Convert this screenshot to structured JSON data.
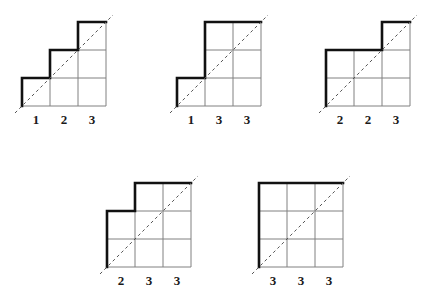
{
  "page": {
    "background_color": "#ffffff",
    "width": 435,
    "height": 294
  },
  "style": {
    "grid_line_color": "#808080",
    "outline_color": "#111111",
    "diagonal_color": "#555555",
    "label_color": "#1a1a1a",
    "cell_size": 28,
    "grid_line_width": 1,
    "outline_width": 2.6,
    "diagonal_width": 1,
    "diagonal_dash": "3 3"
  },
  "figures": [
    {
      "id": "figure-1",
      "name": "staircase-1-2-3",
      "origin": {
        "x": 22,
        "y": 106
      },
      "columns": [
        1,
        2,
        3
      ],
      "labels": [
        "1",
        "2",
        "3"
      ],
      "label_y": 113,
      "diagonal": {
        "from_col": 0,
        "from_row": 0,
        "to_col": 3,
        "to_row": 3
      }
    },
    {
      "id": "figure-2",
      "name": "staircase-1-3-3",
      "origin": {
        "x": 177,
        "y": 106
      },
      "columns": [
        1,
        3,
        3
      ],
      "labels": [
        "1",
        "3",
        "3"
      ],
      "label_y": 113,
      "diagonal": {
        "from_col": 0,
        "from_row": 0,
        "to_col": 3,
        "to_row": 3
      }
    },
    {
      "id": "figure-3",
      "name": "staircase-2-2-3",
      "origin": {
        "x": 326,
        "y": 106
      },
      "columns": [
        2,
        2,
        3
      ],
      "labels": [
        "2",
        "2",
        "3"
      ],
      "label_y": 113,
      "diagonal": {
        "from_col": 0,
        "from_row": 0,
        "to_col": 3,
        "to_row": 3
      }
    },
    {
      "id": "figure-4",
      "name": "staircase-2-3-3",
      "origin": {
        "x": 107,
        "y": 267
      },
      "columns": [
        2,
        3,
        3
      ],
      "labels": [
        "2",
        "3",
        "3"
      ],
      "label_y": 274,
      "diagonal": {
        "from_col": 0,
        "from_row": 0,
        "to_col": 3,
        "to_row": 3
      }
    },
    {
      "id": "figure-5",
      "name": "staircase-3-3-3",
      "origin": {
        "x": 259,
        "y": 267
      },
      "columns": [
        3,
        3,
        3
      ],
      "labels": [
        "3",
        "3",
        "3"
      ],
      "label_y": 274,
      "diagonal": {
        "from_col": 0,
        "from_row": 0,
        "to_col": 3,
        "to_row": 3
      }
    }
  ]
}
